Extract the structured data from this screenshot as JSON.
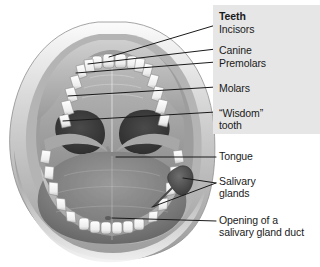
{
  "figure": {
    "kind": "anatomical-illustration",
    "panel_color": "#e6e6e6",
    "leader_line_color": "#1a1a1a",
    "background_color": "#ffffff"
  },
  "labels": {
    "teeth": "Teeth",
    "incisors": "Incisors",
    "canine": "Canine",
    "premolars": "Premolars",
    "molars": "Molars",
    "wisdom": "“Wisdom”\ntooth",
    "tongue": "Tongue",
    "salivary": "Salivary\nglands",
    "opening": "Opening of a\nsalivary gland duct"
  },
  "structures": [
    {
      "name": "upper-lip"
    },
    {
      "name": "lower-lip"
    },
    {
      "name": "upper-teeth-arch"
    },
    {
      "name": "lower-teeth-arch"
    },
    {
      "name": "hard-palate"
    },
    {
      "name": "soft-palate"
    },
    {
      "name": "uvula"
    },
    {
      "name": "tonsil-left"
    },
    {
      "name": "tonsil-right"
    },
    {
      "name": "tongue"
    },
    {
      "name": "salivary-gland"
    },
    {
      "name": "salivary-gland-duct-opening"
    }
  ]
}
